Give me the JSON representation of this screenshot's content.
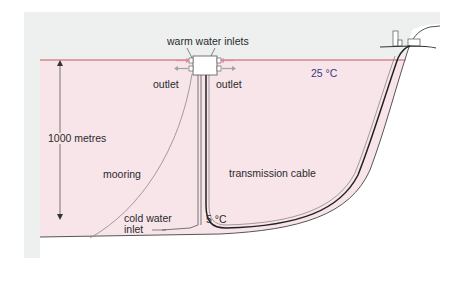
{
  "diagram": {
    "type": "ocean-thermal-energy-conversion-cross-section",
    "colors": {
      "frame_bg": "#eef0f0",
      "sea_fill": "#f8e5ea",
      "surface_line": "#c9565e",
      "land_fill": "#ffffff",
      "line": "#333333",
      "inlet_arrow": "#e08a9a",
      "outlet_arrow": "#9aa7a0",
      "temp_text": "#3a3a7a"
    },
    "labels": {
      "warm_inlets": "warm water inlets",
      "outlet_left": "outlet",
      "outlet_right": "outlet",
      "surface_temp": "25 °C",
      "depth": "1000 metres",
      "mooring": "mooring",
      "transmission_cable": "transmission cable",
      "cold_inlet_line1": "cold water",
      "cold_inlet_line2": "inlet",
      "deep_temp": "5 °C"
    },
    "components": [
      {
        "name": "floating-plant",
        "shape": "square-with-ports"
      },
      {
        "name": "cold-water-pipe",
        "shape": "vertical-double-line"
      },
      {
        "name": "mooring-line",
        "shape": "curve"
      },
      {
        "name": "transmission-cable",
        "shape": "curve-to-shore"
      },
      {
        "name": "shore-building",
        "shape": "small-structures"
      },
      {
        "name": "depth-arrow",
        "shape": "double-headed-vertical-arrow"
      }
    ]
  }
}
